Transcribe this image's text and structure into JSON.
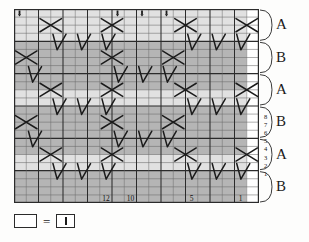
{
  "chart_data": {
    "type": "heatmap",
    "xlabel": "",
    "ylabel": "",
    "grid": true,
    "legend_position": "below-chart",
    "columns": 16,
    "rows": 24,
    "column_numbers": [
      {
        "col": 12,
        "label": "12"
      },
      {
        "col": 10,
        "label": "10"
      },
      {
        "col": 5,
        "label": "5"
      },
      {
        "col": 1,
        "label": "1"
      }
    ],
    "row_numbers": [
      "8",
      "7",
      "6",
      "5",
      "4",
      "3",
      "2",
      "1"
    ],
    "row_number_start_row_index": 13,
    "brackets": [
      {
        "label": "A",
        "start_row": 0,
        "end_row": 3
      },
      {
        "label": "B",
        "start_row": 4,
        "end_row": 7
      },
      {
        "label": "A",
        "start_row": 8,
        "end_row": 11
      },
      {
        "label": "B",
        "start_row": 12,
        "end_row": 15
      },
      {
        "label": "A",
        "start_row": 16,
        "end_row": 19
      },
      {
        "label": "B",
        "start_row": 20,
        "end_row": 23
      }
    ],
    "shaded_row_bands": [
      {
        "start_row": 4,
        "end_row": 9,
        "shade": "dark"
      },
      {
        "start_row": 12,
        "end_row": 17,
        "shade": "dark"
      },
      {
        "start_row": 20,
        "end_row": 23,
        "shade": "dark"
      }
    ],
    "shaded_column_bands": [
      {
        "start_col": 0,
        "end_col": 15,
        "shade": "light"
      }
    ],
    "cable_cross_symbols": [
      {
        "row": 1,
        "col": 2
      },
      {
        "row": 1,
        "col": 7
      },
      {
        "row": 1,
        "col": 13
      },
      {
        "row": 1,
        "col": 18
      },
      {
        "row": 5,
        "col": 0
      },
      {
        "row": 5,
        "col": 7
      },
      {
        "row": 5,
        "col": 12
      },
      {
        "row": 9,
        "col": 2
      },
      {
        "row": 9,
        "col": 7
      },
      {
        "row": 9,
        "col": 13
      },
      {
        "row": 9,
        "col": 18
      },
      {
        "row": 13,
        "col": 0
      },
      {
        "row": 13,
        "col": 7
      },
      {
        "row": 13,
        "col": 12
      },
      {
        "row": 17,
        "col": 2
      },
      {
        "row": 17,
        "col": 7
      },
      {
        "row": 17,
        "col": 13
      },
      {
        "row": 17,
        "col": 18
      }
    ],
    "slip_stitch_symbols": [
      {
        "row": 3,
        "col": 3
      },
      {
        "row": 3,
        "col": 5
      },
      {
        "row": 3,
        "col": 7
      },
      {
        "row": 3,
        "col": 14
      },
      {
        "row": 3,
        "col": 16
      },
      {
        "row": 3,
        "col": 18
      },
      {
        "row": 7,
        "col": 1
      },
      {
        "row": 7,
        "col": 8
      },
      {
        "row": 7,
        "col": 10
      },
      {
        "row": 7,
        "col": 12
      },
      {
        "row": 11,
        "col": 3
      },
      {
        "row": 11,
        "col": 5
      },
      {
        "row": 11,
        "col": 7
      },
      {
        "row": 11,
        "col": 14
      },
      {
        "row": 11,
        "col": 16
      },
      {
        "row": 11,
        "col": 18
      },
      {
        "row": 15,
        "col": 1
      },
      {
        "row": 15,
        "col": 8
      },
      {
        "row": 15,
        "col": 10
      },
      {
        "row": 15,
        "col": 12
      },
      {
        "row": 19,
        "col": 3
      },
      {
        "row": 19,
        "col": 5
      },
      {
        "row": 19,
        "col": 7
      },
      {
        "row": 19,
        "col": 14
      },
      {
        "row": 19,
        "col": 16
      },
      {
        "row": 19,
        "col": 18
      }
    ],
    "top_tick_marks": [
      {
        "col": 0
      },
      {
        "col": 8
      },
      {
        "col": 10
      },
      {
        "col": 12
      }
    ],
    "colors": {
      "grid_line": "#2b2b2b",
      "grid_line_light": "#6b6b6b",
      "shade_dark": "#9a9a9a",
      "shade_light": "#c9c9c9",
      "background": "#ffffff",
      "symbol": "#1b1b1b"
    }
  },
  "legend": {
    "empty_box_label": "",
    "equals": "=",
    "symbol_box_label": "",
    "symbol_name": "knit-stitch-bar"
  }
}
